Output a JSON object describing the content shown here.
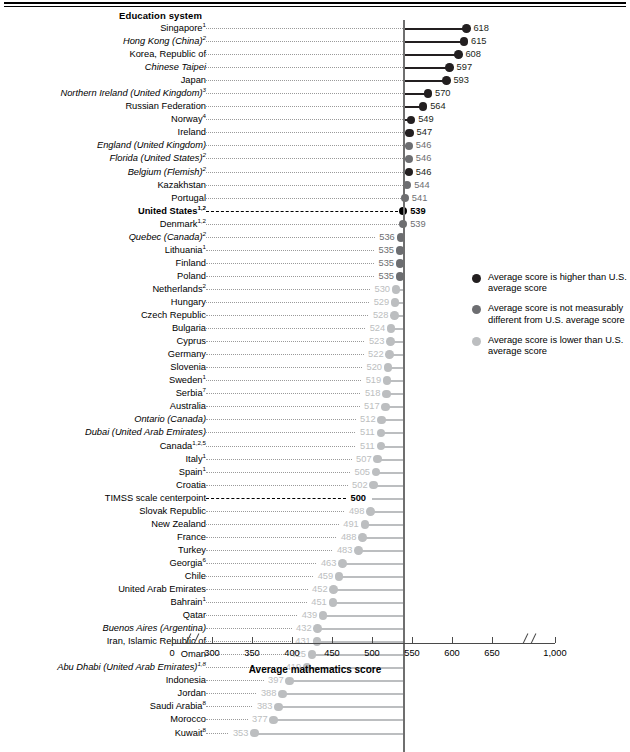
{
  "header": {
    "column_header": "Education system"
  },
  "axis": {
    "title": "Average mathematics score",
    "ticks": [
      "0",
      "300",
      "350",
      "400",
      "450",
      "500",
      "550",
      "600",
      "650",
      "1,000"
    ],
    "tick_values": [
      0,
      300,
      350,
      400,
      450,
      500,
      550,
      600,
      650,
      1000
    ],
    "has_break_low": true,
    "has_break_high": true
  },
  "legend": {
    "items": [
      {
        "color": "#231f20",
        "label": "Average score is higher than U.S. average score",
        "key": "higher"
      },
      {
        "color": "#6d6e71",
        "label": "Average score is not measurably different from U.S. average score",
        "key": "same"
      },
      {
        "color": "#bcbec0",
        "label": "Average score is lower than U.S. average score",
        "key": "lower"
      }
    ]
  },
  "colors": {
    "higher": "#231f20",
    "same": "#6d6e71",
    "lower": "#bcbec0",
    "us": "#000000",
    "reference_line": "#6f6f6f"
  },
  "chart_data": {
    "type": "bar",
    "xlabel": "Average mathematics score",
    "ylabel": "Education system",
    "xlim": [
      350,
      650
    ],
    "reference_value": 539,
    "grid": false,
    "legend_position": "right",
    "categories": [
      "Singapore",
      "Hong Kong (China)",
      "Korea, Republic of",
      "Chinese Taipei",
      "Japan",
      "Northern Ireland (United Kingdom)",
      "Russian Federation",
      "Norway",
      "Ireland",
      "England (United Kingdom)",
      "Florida (United States)",
      "Belgium (Flemish)",
      "Kazakhstan",
      "Portugal",
      "United States",
      "Denmark",
      "Quebec (Canada)",
      "Lithuania",
      "Finland",
      "Poland",
      "Netherlands",
      "Hungary",
      "Czech Republic",
      "Bulgaria",
      "Cyprus",
      "Germany",
      "Slovenia",
      "Sweden",
      "Serbia",
      "Australia",
      "Ontario (Canada)",
      "Dubai (United Arab Emirates)",
      "Canada",
      "Italy",
      "Spain",
      "Croatia",
      "TIMSS scale centerpoint",
      "Slovak Republic",
      "New Zealand",
      "France",
      "Turkey",
      "Georgia",
      "Chile",
      "United Arab Emirates",
      "Bahrain",
      "Qatar",
      "Buenos Aires (Argentina)",
      "Iran, Islamic Republic of",
      "Oman",
      "Abu Dhabi (United Arab Emirates)",
      "Indonesia",
      "Jordan",
      "Saudi Arabia",
      "Morocco",
      "Kuwait"
    ],
    "values": [
      618,
      615,
      608,
      597,
      593,
      570,
      564,
      549,
      547,
      546,
      546,
      546,
      544,
      541,
      539,
      539,
      536,
      535,
      535,
      535,
      530,
      529,
      528,
      524,
      523,
      522,
      520,
      519,
      518,
      517,
      512,
      511,
      511,
      507,
      505,
      502,
      500,
      498,
      491,
      488,
      483,
      463,
      459,
      452,
      451,
      439,
      432,
      431,
      425,
      419,
      397,
      388,
      383,
      377,
      353
    ]
  },
  "rows": [
    {
      "label": "Singapore",
      "sup": "1",
      "value": "618",
      "v": 618,
      "group": "higher",
      "italic": false,
      "bold": false
    },
    {
      "label": "Hong Kong (China)",
      "sup": "2",
      "value": "615",
      "v": 615,
      "group": "higher",
      "italic": true,
      "bold": false
    },
    {
      "label": "Korea, Republic of",
      "sup": "",
      "value": "608",
      "v": 608,
      "group": "higher",
      "italic": false,
      "bold": false
    },
    {
      "label": "Chinese Taipei",
      "sup": "",
      "value": "597",
      "v": 597,
      "group": "higher",
      "italic": true,
      "bold": false
    },
    {
      "label": "Japan",
      "sup": "",
      "value": "593",
      "v": 593,
      "group": "higher",
      "italic": false,
      "bold": false
    },
    {
      "label": "Northern Ireland (United Kingdom)",
      "sup": "3",
      "value": "570",
      "v": 570,
      "group": "higher",
      "italic": true,
      "bold": false
    },
    {
      "label": "Russian Federation",
      "sup": "",
      "value": "564",
      "v": 564,
      "group": "higher",
      "italic": false,
      "bold": false
    },
    {
      "label": "Norway",
      "sup": "4",
      "value": "549",
      "v": 549,
      "group": "higher",
      "italic": false,
      "bold": false
    },
    {
      "label": "Ireland",
      "sup": "",
      "value": "547",
      "v": 547,
      "group": "higher",
      "italic": false,
      "bold": false
    },
    {
      "label": "England (United Kingdom)",
      "sup": "",
      "value": "546",
      "v": 546,
      "group": "same",
      "italic": true,
      "bold": false
    },
    {
      "label": "Florida (United States)",
      "sup": "2",
      "value": "546",
      "v": 546,
      "group": "same",
      "italic": true,
      "bold": false
    },
    {
      "label": "Belgium (Flemish)",
      "sup": "2",
      "value": "546",
      "v": 546,
      "group": "higher",
      "italic": true,
      "bold": false
    },
    {
      "label": "Kazakhstan",
      "sup": "",
      "value": "544",
      "v": 544,
      "group": "same",
      "italic": false,
      "bold": false
    },
    {
      "label": "Portugal",
      "sup": "",
      "value": "541",
      "v": 541,
      "group": "same",
      "italic": false,
      "bold": false
    },
    {
      "label": "United States",
      "sup": "1,2",
      "value": "539",
      "v": 539,
      "group": "us",
      "italic": false,
      "bold": true
    },
    {
      "label": "Denmark",
      "sup": "1,2",
      "value": "539",
      "v": 539,
      "group": "same",
      "italic": false,
      "bold": false
    },
    {
      "label": "Quebec (Canada)",
      "sup": "2",
      "value": "536",
      "v": 536,
      "group": "same",
      "italic": true,
      "bold": false
    },
    {
      "label": "Lithuania",
      "sup": "1",
      "value": "535",
      "v": 535,
      "group": "same",
      "italic": false,
      "bold": false
    },
    {
      "label": "Finland",
      "sup": "",
      "value": "535",
      "v": 535,
      "group": "same",
      "italic": false,
      "bold": false
    },
    {
      "label": "Poland",
      "sup": "",
      "value": "535",
      "v": 535,
      "group": "same",
      "italic": false,
      "bold": false
    },
    {
      "label": "Netherlands",
      "sup": "2",
      "value": "530",
      "v": 530,
      "group": "lower",
      "italic": false,
      "bold": false
    },
    {
      "label": "Hungary",
      "sup": "",
      "value": "529",
      "v": 529,
      "group": "lower",
      "italic": false,
      "bold": false
    },
    {
      "label": "Czech Republic",
      "sup": "",
      "value": "528",
      "v": 528,
      "group": "lower",
      "italic": false,
      "bold": false
    },
    {
      "label": "Bulgaria",
      "sup": "",
      "value": "524",
      "v": 524,
      "group": "lower",
      "italic": false,
      "bold": false
    },
    {
      "label": "Cyprus",
      "sup": "",
      "value": "523",
      "v": 523,
      "group": "lower",
      "italic": false,
      "bold": false
    },
    {
      "label": "Germany",
      "sup": "",
      "value": "522",
      "v": 522,
      "group": "lower",
      "italic": false,
      "bold": false
    },
    {
      "label": "Slovenia",
      "sup": "",
      "value": "520",
      "v": 520,
      "group": "lower",
      "italic": false,
      "bold": false
    },
    {
      "label": "Sweden",
      "sup": "1",
      "value": "519",
      "v": 519,
      "group": "lower",
      "italic": false,
      "bold": false
    },
    {
      "label": "Serbia",
      "sup": "7",
      "value": "518",
      "v": 518,
      "group": "lower",
      "italic": false,
      "bold": false
    },
    {
      "label": "Australia",
      "sup": "",
      "value": "517",
      "v": 517,
      "group": "lower",
      "italic": false,
      "bold": false
    },
    {
      "label": "Ontario (Canada)",
      "sup": "",
      "value": "512",
      "v": 512,
      "group": "lower",
      "italic": true,
      "bold": false
    },
    {
      "label": "Dubai (United Arab Emirates)",
      "sup": "",
      "value": "511",
      "v": 511,
      "group": "lower",
      "italic": true,
      "bold": false
    },
    {
      "label": "Canada",
      "sup": "1,2,5",
      "value": "511",
      "v": 511,
      "group": "lower",
      "italic": false,
      "bold": false
    },
    {
      "label": "Italy",
      "sup": "1",
      "value": "507",
      "v": 507,
      "group": "lower",
      "italic": false,
      "bold": false
    },
    {
      "label": "Spain",
      "sup": "1",
      "value": "505",
      "v": 505,
      "group": "lower",
      "italic": false,
      "bold": false
    },
    {
      "label": "Croatia",
      "sup": "",
      "value": "502",
      "v": 502,
      "group": "lower",
      "italic": false,
      "bold": false
    },
    {
      "label": "TIMSS scale centerpoint",
      "sup": "",
      "value": "500",
      "v": 500,
      "group": "centerpoint",
      "italic": false,
      "bold": false
    },
    {
      "label": "Slovak Republic",
      "sup": "",
      "value": "498",
      "v": 498,
      "group": "lower",
      "italic": false,
      "bold": false
    },
    {
      "label": "New Zealand",
      "sup": "",
      "value": "491",
      "v": 491,
      "group": "lower",
      "italic": false,
      "bold": false
    },
    {
      "label": "France",
      "sup": "",
      "value": "488",
      "v": 488,
      "group": "lower",
      "italic": false,
      "bold": false
    },
    {
      "label": "Turkey",
      "sup": "",
      "value": "483",
      "v": 483,
      "group": "lower",
      "italic": false,
      "bold": false
    },
    {
      "label": "Georgia",
      "sup": "6",
      "value": "463",
      "v": 463,
      "group": "lower",
      "italic": false,
      "bold": false
    },
    {
      "label": "Chile",
      "sup": "",
      "value": "459",
      "v": 459,
      "group": "lower",
      "italic": false,
      "bold": false
    },
    {
      "label": "United Arab Emirates",
      "sup": "",
      "value": "452",
      "v": 452,
      "group": "lower",
      "italic": false,
      "bold": false
    },
    {
      "label": "Bahrain",
      "sup": "1",
      "value": "451",
      "v": 451,
      "group": "lower",
      "italic": false,
      "bold": false
    },
    {
      "label": "Qatar",
      "sup": "",
      "value": "439",
      "v": 439,
      "group": "lower",
      "italic": false,
      "bold": false
    },
    {
      "label": "Buenos Aires (Argentina)",
      "sup": "",
      "value": "432",
      "v": 432,
      "group": "lower",
      "italic": true,
      "bold": false
    },
    {
      "label": "Iran, Islamic Republic of",
      "sup": "",
      "value": "431",
      "v": 431,
      "group": "lower",
      "italic": false,
      "bold": false
    },
    {
      "label": "Oman",
      "sup": "",
      "value": "425",
      "v": 425,
      "group": "lower",
      "italic": false,
      "bold": false
    },
    {
      "label": "Abu Dhabi (United Arab Emirates)",
      "sup": "1,8",
      "value": "419",
      "v": 419,
      "group": "lower",
      "italic": true,
      "bold": false
    },
    {
      "label": "Indonesia",
      "sup": "",
      "value": "397",
      "v": 397,
      "group": "lower",
      "italic": false,
      "bold": false
    },
    {
      "label": "Jordan",
      "sup": "",
      "value": "388",
      "v": 388,
      "group": "lower",
      "italic": false,
      "bold": false
    },
    {
      "label": "Saudi Arabia",
      "sup": "8",
      "value": "383",
      "v": 383,
      "group": "lower",
      "italic": false,
      "bold": false
    },
    {
      "label": "Morocco",
      "sup": "",
      "value": "377",
      "v": 377,
      "group": "lower",
      "italic": false,
      "bold": false
    },
    {
      "label": "Kuwait",
      "sup": "8",
      "value": "353",
      "v": 353,
      "group": "lower",
      "italic": false,
      "bold": false
    }
  ]
}
